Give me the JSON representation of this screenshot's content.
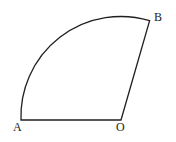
{
  "figure": {
    "background_color": "#ffffff",
    "stroke_color": "#231f20",
    "stroke_width": 1.3,
    "fill_color": "none",
    "canvas": {
      "width": 176,
      "height": 142
    },
    "labels": [
      {
        "id": "A",
        "text": "A",
        "x": 13,
        "y": 121
      },
      {
        "id": "O",
        "text": "O",
        "x": 116,
        "y": 121
      },
      {
        "id": "B",
        "text": "B",
        "x": 154,
        "y": 11
      }
    ],
    "points": {
      "A": {
        "x": 21,
        "y": 120
      },
      "O": {
        "x": 121,
        "y": 120
      },
      "B": {
        "x": 149,
        "y": 21
      }
    },
    "arc": {
      "center_x": 121,
      "center_y": 120,
      "radius": 100,
      "start_point": "A",
      "end_point": "B",
      "sweep": "counterclockwise"
    },
    "segments": [
      {
        "name": "segment-AO",
        "from": "A",
        "to": "O"
      },
      {
        "name": "segment-OB",
        "from": "O",
        "to": "B"
      }
    ],
    "path_d": "M 21 120 A 100 100 0 0 1 149.6 20.7 L 121 120 Z"
  }
}
